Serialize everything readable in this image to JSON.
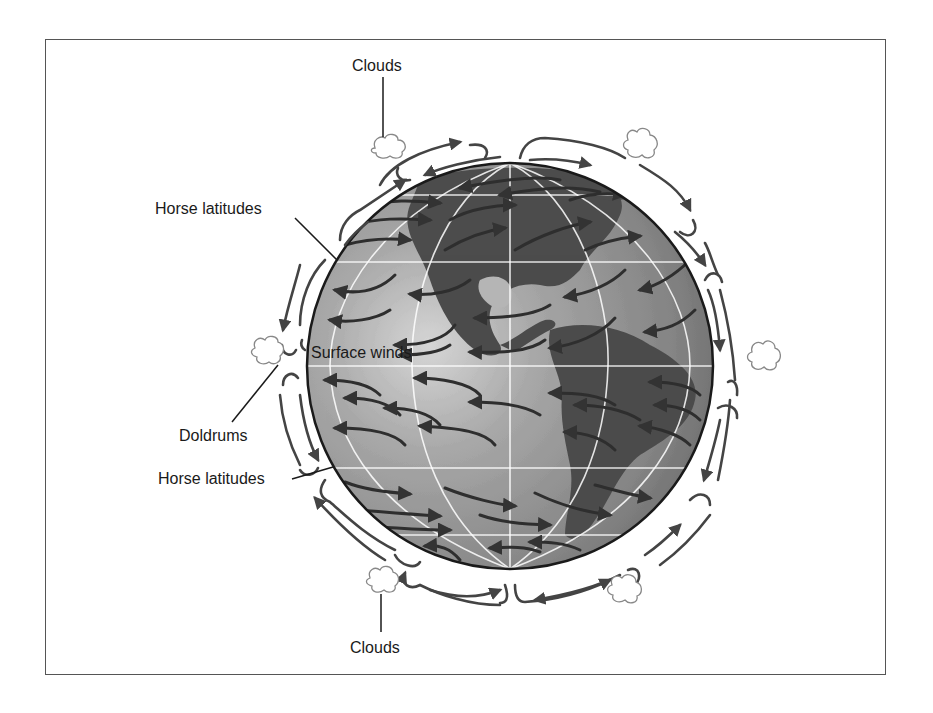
{
  "diagram": {
    "labels": {
      "clouds_top": "Clouds",
      "clouds_bottom": "Clouds",
      "horse_latitudes_north": "Horse latitudes",
      "doldrums": "Doldrums",
      "horse_latitudes_south": "Horse latitudes",
      "surface_winds": "Surface winds"
    },
    "colors": {
      "ocean": "#9a9a9a",
      "land": "#4d4d4d",
      "arrow": "#333333",
      "gridline": "#ffffff",
      "frame": "#555555",
      "cloud_outline": "#888888"
    },
    "globe": {
      "cx": 510,
      "cy": 366,
      "r": 203
    },
    "components": [
      "globe",
      "surface wind arrows",
      "circulation cells",
      "clouds",
      "callout labels"
    ]
  }
}
